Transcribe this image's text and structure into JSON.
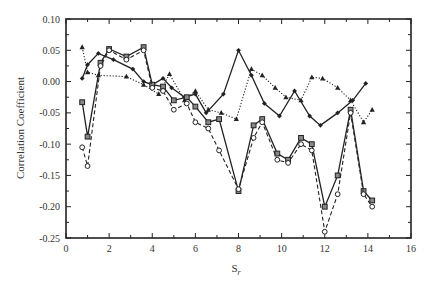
{
  "chart_data": {
    "type": "line",
    "title": "",
    "xlabel": "S",
    "xlabel_subscript": "r",
    "ylabel": "Correlation Coefficient",
    "xlim": [
      0,
      16
    ],
    "ylim": [
      -0.25,
      0.1
    ],
    "grid": false,
    "legend": "none",
    "x_ticks": [
      "0",
      "2",
      "4",
      "6",
      "8",
      "10",
      "12",
      "14",
      "16"
    ],
    "y_ticks": [
      "0.10",
      "0.05",
      "0.00",
      "-0.05",
      "-0.10",
      "-0.15",
      "-0.20",
      "-0.25"
    ],
    "series": [
      {
        "name": "series-1-solid-diamond",
        "line": "solid",
        "marker": "diamond-filled",
        "x": [
          0.75,
          1.0,
          1.5,
          2.2,
          3.1,
          3.6,
          4.0,
          4.5,
          4.9,
          5.5,
          6.0,
          6.5,
          7.3,
          8.0,
          8.6,
          9.2,
          9.9,
          10.6,
          11.3,
          11.8,
          12.6,
          13.3,
          13.9
        ],
        "y": [
          0.005,
          0.027,
          0.045,
          0.035,
          0.02,
          0.0,
          -0.005,
          0.005,
          -0.01,
          -0.025,
          -0.02,
          -0.05,
          -0.02,
          0.05,
          0.01,
          -0.035,
          -0.055,
          -0.015,
          -0.055,
          -0.07,
          -0.05,
          -0.03,
          -0.003
        ]
      },
      {
        "name": "series-2-dotted-triangle",
        "line": "dotted",
        "marker": "triangle-filled",
        "x": [
          0.75,
          1.0,
          1.5,
          2.8,
          3.6,
          4.3,
          4.8,
          5.5,
          6.0,
          6.6,
          7.2,
          7.9,
          8.6,
          9.1,
          9.7,
          10.2,
          10.9,
          11.4,
          11.9,
          12.6,
          13.2,
          13.8,
          14.2
        ],
        "y": [
          0.055,
          0.015,
          0.01,
          0.008,
          -0.005,
          -0.02,
          0.012,
          -0.03,
          -0.015,
          -0.045,
          -0.05,
          -0.06,
          0.02,
          0.01,
          -0.01,
          -0.025,
          -0.03,
          0.007,
          0.005,
          -0.01,
          -0.03,
          -0.065,
          -0.045
        ]
      },
      {
        "name": "series-3-solid-square",
        "line": "solid",
        "marker": "square-open",
        "x": [
          0.75,
          1.0,
          1.6,
          2.0,
          2.8,
          3.6,
          4.0,
          4.5,
          5.0,
          5.6,
          6.0,
          6.6,
          7.1,
          8.0,
          8.7,
          9.1,
          9.8,
          10.3,
          10.9,
          11.4,
          12.0,
          12.6,
          13.2,
          13.8,
          14.2
        ],
        "y": [
          -0.033,
          -0.088,
          0.03,
          0.052,
          0.04,
          0.055,
          -0.005,
          -0.008,
          -0.03,
          -0.025,
          -0.04,
          -0.065,
          -0.06,
          -0.175,
          -0.07,
          -0.06,
          -0.115,
          -0.125,
          -0.09,
          -0.1,
          -0.2,
          -0.15,
          -0.045,
          -0.175,
          -0.19
        ]
      },
      {
        "name": "series-4-dashed-circle",
        "line": "dashed",
        "marker": "circle-open",
        "x": [
          0.75,
          1.0,
          1.6,
          2.0,
          2.8,
          3.6,
          4.0,
          4.5,
          5.0,
          5.6,
          6.0,
          6.6,
          7.1,
          8.0,
          8.7,
          9.1,
          9.8,
          10.3,
          10.9,
          11.4,
          12.0,
          12.6,
          13.2,
          13.8,
          14.2
        ],
        "y": [
          -0.105,
          -0.135,
          0.025,
          0.05,
          0.035,
          0.05,
          -0.01,
          -0.015,
          -0.045,
          -0.035,
          -0.065,
          -0.075,
          -0.11,
          -0.172,
          -0.09,
          -0.065,
          -0.125,
          -0.13,
          -0.1,
          -0.11,
          -0.24,
          -0.18,
          -0.05,
          -0.18,
          -0.2
        ]
      }
    ]
  },
  "axes": {
    "ylabel": "Correlation Coefficient",
    "xlabel": "S",
    "xlabel_sub": "r"
  }
}
